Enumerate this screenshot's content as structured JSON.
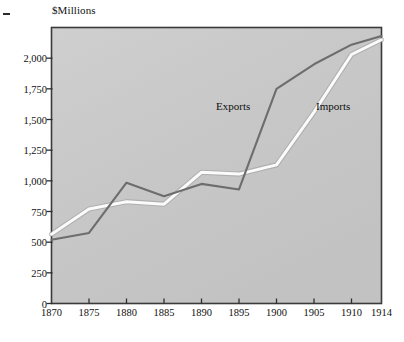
{
  "figure": {
    "axis_title": "$Millions",
    "left_margin_dash": "dash-mark",
    "plot_bg_color": "#c9c9c9",
    "frame_color": "#3a3a3a",
    "exports_color": "#6d6d6d",
    "imports_color": "#fbfbfb"
  },
  "labels": {
    "exports": "Exports",
    "imports": "Imports"
  },
  "chart_data": {
    "type": "line",
    "title": "$Millions",
    "xlabel": "",
    "ylabel": "$Millions",
    "xlim": [
      1870,
      1914
    ],
    "ylim": [
      0,
      2250
    ],
    "grid": false,
    "legend_position": "inline-annotations",
    "x": [
      1870,
      1875,
      1880,
      1885,
      1890,
      1895,
      1900,
      1905,
      1910,
      1914
    ],
    "xtick_labels": [
      "1870",
      "1875",
      "1880",
      "1885",
      "1890",
      "1895",
      "1900",
      "1905",
      "1910",
      "1914"
    ],
    "ytick_values": [
      0,
      250,
      500,
      750,
      1000,
      1250,
      1500,
      1750,
      2000
    ],
    "ytick_labels": [
      "0",
      "250",
      "500",
      "750",
      "1,000",
      "1,250",
      "1,500",
      "1,750",
      "2,000"
    ],
    "series": [
      {
        "name": "Exports",
        "color": "#6d6d6d",
        "values": [
          520,
          575,
          985,
          875,
          975,
          930,
          1750,
          1950,
          2110,
          2180
        ]
      },
      {
        "name": "Imports",
        "color": "#fbfbfb",
        "values": [
          565,
          770,
          830,
          810,
          1070,
          1055,
          1130,
          1560,
          2030,
          2150
        ]
      }
    ],
    "annotations": [
      {
        "text": "Exports",
        "x": 1893,
        "y": 1480
      },
      {
        "text": "Imports",
        "x": 1906,
        "y": 1480
      }
    ]
  }
}
